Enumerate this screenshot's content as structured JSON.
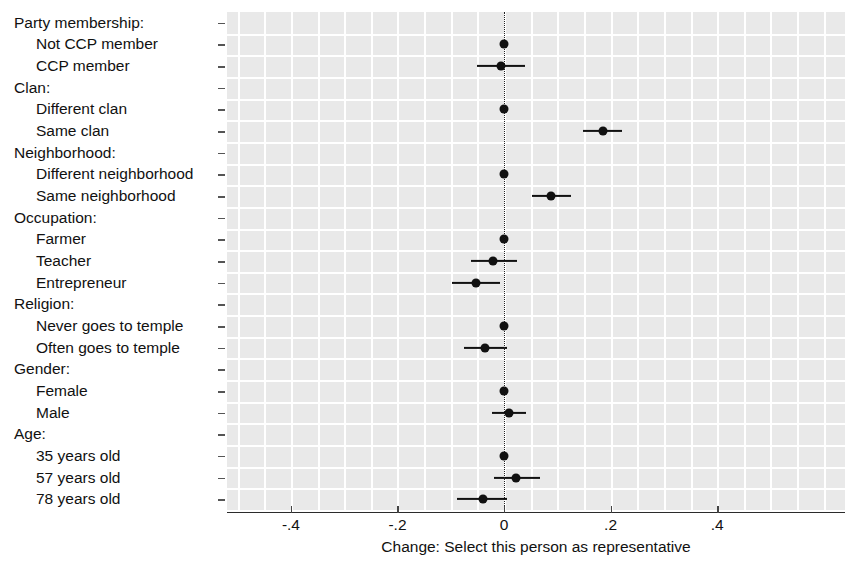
{
  "chart_data": {
    "type": "scatter",
    "title": "",
    "subtitle": "",
    "xlabel": "Change: Select this person as representative",
    "ylabel": "",
    "xlim": [
      -0.52,
      0.64
    ],
    "xticks": [
      -0.4,
      -0.2,
      0,
      0.2,
      0.4
    ],
    "xticklabels": [
      "-.4",
      "-.2",
      "0",
      ".2",
      ".4"
    ],
    "grid": true,
    "legend": null,
    "zero_reference_line": 0,
    "orientation": "horizontal",
    "note": "Coefficient / AMCE dot-and-whisker plot with 95% confidence intervals; reference levels shown as points at 0 with no interval.",
    "rows": [
      {
        "label": "Party membership:",
        "kind": "group"
      },
      {
        "label": "Not CCP member",
        "kind": "level",
        "estimate": 0.0,
        "ci_low": 0.0,
        "ci_high": 0.0,
        "reference": true
      },
      {
        "label": "CCP member",
        "kind": "level",
        "estimate": -0.005,
        "ci_low": -0.05,
        "ci_high": 0.04,
        "reference": false
      },
      {
        "label": "Clan:",
        "kind": "group"
      },
      {
        "label": "Different clan",
        "kind": "level",
        "estimate": 0.0,
        "ci_low": 0.0,
        "ci_high": 0.0,
        "reference": true
      },
      {
        "label": "Same clan",
        "kind": "level",
        "estimate": 0.185,
        "ci_low": 0.148,
        "ci_high": 0.222,
        "reference": false
      },
      {
        "label": "Neighborhood:",
        "kind": "group"
      },
      {
        "label": "Different neighborhood",
        "kind": "level",
        "estimate": 0.0,
        "ci_low": 0.0,
        "ci_high": 0.0,
        "reference": true
      },
      {
        "label": "Same neighborhood",
        "kind": "level",
        "estimate": 0.088,
        "ci_low": 0.052,
        "ci_high": 0.125,
        "reference": false
      },
      {
        "label": "Occupation:",
        "kind": "group"
      },
      {
        "label": "Farmer",
        "kind": "level",
        "estimate": 0.0,
        "ci_low": 0.0,
        "ci_high": 0.0,
        "reference": true
      },
      {
        "label": "Teacher",
        "kind": "level",
        "estimate": -0.02,
        "ci_low": -0.062,
        "ci_high": 0.025,
        "reference": false
      },
      {
        "label": "Entrepreneur",
        "kind": "level",
        "estimate": -0.052,
        "ci_low": -0.098,
        "ci_high": -0.008,
        "reference": false
      },
      {
        "label": "Religion:",
        "kind": "group"
      },
      {
        "label": "Never goes to temple",
        "kind": "level",
        "estimate": 0.0,
        "ci_low": 0.0,
        "ci_high": 0.0,
        "reference": true
      },
      {
        "label": "Often goes to temple",
        "kind": "level",
        "estimate": -0.035,
        "ci_low": -0.075,
        "ci_high": 0.005,
        "reference": false
      },
      {
        "label": "Gender:",
        "kind": "group"
      },
      {
        "label": "Female",
        "kind": "level",
        "estimate": 0.0,
        "ci_low": 0.0,
        "ci_high": 0.0,
        "reference": true
      },
      {
        "label": "Male",
        "kind": "level",
        "estimate": 0.01,
        "ci_low": -0.022,
        "ci_high": 0.042,
        "reference": false
      },
      {
        "label": "Age:",
        "kind": "group"
      },
      {
        "label": "35 years old",
        "kind": "level",
        "estimate": 0.0,
        "ci_low": 0.0,
        "ci_high": 0.0,
        "reference": true
      },
      {
        "label": "57 years old",
        "kind": "level",
        "estimate": 0.022,
        "ci_low": -0.018,
        "ci_high": 0.068,
        "reference": false
      },
      {
        "label": "78 years old",
        "kind": "level",
        "estimate": -0.04,
        "ci_low": -0.088,
        "ci_high": 0.005,
        "reference": false
      }
    ],
    "colors": {
      "point": "#111111",
      "interval": "#111111",
      "panel_background": "#e9e9e9",
      "gridline": "#ffffff",
      "zero_line": "#222222",
      "text": "#111111"
    }
  }
}
